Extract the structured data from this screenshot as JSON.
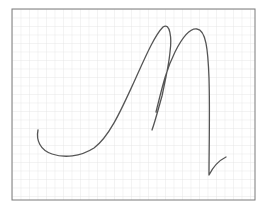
{
  "canvas": {
    "width": 263,
    "height": 209,
    "background": "#ffffff"
  },
  "paper": {
    "x": 12,
    "y": 9,
    "width": 243,
    "height": 191,
    "border_color": "#7a7a7a",
    "grid_color": "#e2e2e2",
    "grid_spacing": 8.5
  },
  "stroke": {
    "color": "#555555",
    "width": 1.3,
    "path": "M38,130 C36,140 40,150 52,154 C64,158 80,157 94,148 C110,136 122,108 134,82 C144,60 154,36 163,27 C170,22 172,38 170,52 C169,64 165,82 162,96 C158,110 155,122 152,130 M156,112 C162,88 166,70 175,52 C182,38 190,28 197,29 C206,30 208,50 209,78 C210,110 209,150 209,175 C214,165 220,160 226,157"
  }
}
